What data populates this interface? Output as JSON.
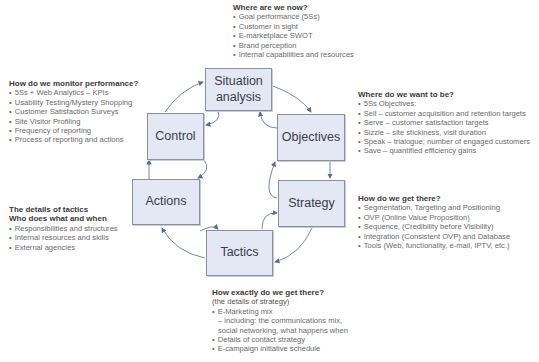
{
  "diagram": {
    "type": "cycle",
    "boxes": [
      {
        "id": "situation",
        "label": "Situation analysis",
        "line1": "Situation",
        "line2": "analysis"
      },
      {
        "id": "objectives",
        "label": "Objectives"
      },
      {
        "id": "strategy",
        "label": "Strategy"
      },
      {
        "id": "tactics",
        "label": "Tactics"
      },
      {
        "id": "actions",
        "label": "Actions"
      },
      {
        "id": "control",
        "label": "Control"
      }
    ],
    "flow": [
      "Situation analysis",
      "Objectives",
      "Strategy",
      "Tactics",
      "Actions",
      "Control",
      "Situation analysis"
    ]
  },
  "annotations": {
    "situation": {
      "heading": "Where are we now?",
      "items": [
        "Goal performance (5Ss)",
        "Customer in sight",
        "E-marketplace SWOT",
        "Brand perception",
        "Internal capabilities and resources"
      ]
    },
    "objectives": {
      "heading": "Where do we want to be?",
      "items": [
        "5Ss Objectives:",
        "Sell – customer acquisition and retention targets",
        "Serve – customer satisfaction targets",
        "Sizzle – site stickiness, visit duration",
        "Speak – trialogue; number of engaged customers",
        "Save – quantified efficiency gains"
      ]
    },
    "strategy": {
      "heading": "How do we get there?",
      "items": [
        "Segmentation, Targeting and Positioning",
        "OVP (Online Value Proposition)",
        "Sequence, (Credibility before Visibility)",
        "Integration (Consistent OVP) and Database",
        "Tools (Web, functionality, e-mail, IPTV, etc.)"
      ]
    },
    "tactics": {
      "heading": "How exactly do we get there?",
      "subheading": "(the details of strategy)",
      "items": [
        "E-Marketing mix",
        "– including: the communications mix,",
        "social networking, what happens when",
        "Details of contact strategy",
        "E-campaign initiative schedule"
      ]
    },
    "actions": {
      "heading": "The details of tactics",
      "heading2": "Who does what and when",
      "items": [
        "Responsibilities and structures",
        "Internal resources and skills",
        "External agencies"
      ]
    },
    "control": {
      "heading": "How do we monitor performance?",
      "items": [
        "5Ss + Web Analytics – KPIs",
        "Usability Testing/Mystery Shopping",
        "Customer Satisfaction Surveys",
        "Site Visitor Profiling",
        "Frequency of reporting",
        "Process of reporting and actions"
      ]
    }
  },
  "colors": {
    "box_fill": "#e3e8f4",
    "box_border": "#8b90a0",
    "arrow": "#5a6aa0",
    "text": "#6a6a6a"
  }
}
